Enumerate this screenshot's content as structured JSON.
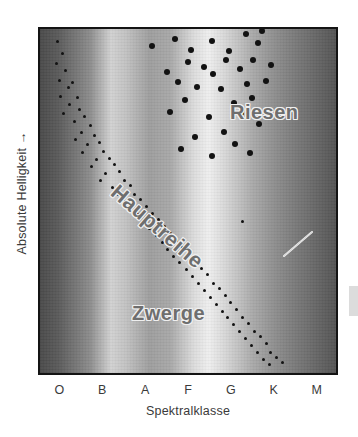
{
  "figure": {
    "axes": {
      "y_label": "Absolute Helligkeit →",
      "x_label": "Spektralklasse",
      "x_ticks": [
        "O",
        "B",
        "A",
        "F",
        "G",
        "K",
        "M"
      ]
    },
    "annotations": {
      "giants": "Riesen",
      "main_sequence": "Hauptreihe",
      "dwarfs": "Zwerge",
      "sun": "Sonne"
    },
    "colors": {
      "frame": "#141414",
      "star": "#121212",
      "text": "#3a3a3a",
      "label_fill": "#6e6e6e",
      "label_outline": "#f2f2f2",
      "leader_line": "#f0f0f0"
    }
  },
  "chart_data": {
    "type": "scatter",
    "xlabel": "Spektralklasse",
    "ylabel": "Absolute Helligkeit →",
    "xlim": [
      0,
      100
    ],
    "ylim": [
      0,
      100
    ],
    "grid": false,
    "legend": "none",
    "x_tick_labels": [
      "O",
      "B",
      "A",
      "F",
      "G",
      "K",
      "M"
    ],
    "x_tick_positions": [
      7.1,
      21.4,
      35.7,
      50.0,
      64.3,
      78.6,
      92.9
    ],
    "x_axis_note": "Spectral class, hot/blue (O) at left to cool/red (M) at right",
    "y_axis_note": "Absolute brightness increasing upward",
    "background": "vertical spectral gradient bands, dark at edges, bright near A and G",
    "annotations": [
      {
        "text": "Riesen",
        "x": 53.5,
        "y": 80.5,
        "rotation": 0,
        "meaning": "giants"
      },
      {
        "text": "Hauptreihe",
        "x": 13.0,
        "y": 57.0,
        "rotation": 41,
        "meaning": "main sequence"
      },
      {
        "text": "Zwerge",
        "x": 19.0,
        "y": 22.5,
        "rotation": 0,
        "meaning": "dwarfs"
      },
      {
        "text": "Sonne",
        "x": 78.0,
        "y": 53.5,
        "rotation": 0,
        "meaning": "the Sun",
        "leader_from": [
          77.0,
          51.5
        ],
        "leader_to": [
          68.5,
          44.0
        ]
      }
    ],
    "series": [
      {
        "name": "Riesen",
        "marker_size": 6,
        "points": [
          [
            38.0,
            95.0
          ],
          [
            45.5,
            97.0
          ],
          [
            51.0,
            94.0
          ],
          [
            58.0,
            96.5
          ],
          [
            64.0,
            93.5
          ],
          [
            69.5,
            98.5
          ],
          [
            73.5,
            96.0
          ],
          [
            75.0,
            99.5
          ],
          [
            63.0,
            91.0
          ],
          [
            55.5,
            89.0
          ],
          [
            50.0,
            90.5
          ],
          [
            43.0,
            87.5
          ],
          [
            58.5,
            87.0
          ],
          [
            67.5,
            88.5
          ],
          [
            72.0,
            91.0
          ],
          [
            78.0,
            89.5
          ],
          [
            46.5,
            84.5
          ],
          [
            53.0,
            83.0
          ],
          [
            61.0,
            82.5
          ],
          [
            70.0,
            84.0
          ],
          [
            76.5,
            85.0
          ],
          [
            49.0,
            79.5
          ],
          [
            65.5,
            78.5
          ],
          [
            71.5,
            80.0
          ],
          [
            44.0,
            76.0
          ],
          [
            57.0,
            74.5
          ],
          [
            68.0,
            75.5
          ],
          [
            74.0,
            72.5
          ],
          [
            62.0,
            70.0
          ],
          [
            52.5,
            68.5
          ],
          [
            66.0,
            66.5
          ],
          [
            71.0,
            64.0
          ],
          [
            58.0,
            63.0
          ],
          [
            47.5,
            65.0
          ]
        ]
      },
      {
        "name": "Hauptreihe",
        "marker_size": 3,
        "points": [
          [
            6.0,
            96.5
          ],
          [
            7.5,
            93.0
          ],
          [
            5.5,
            90.0
          ],
          [
            8.5,
            88.0
          ],
          [
            6.5,
            85.0
          ],
          [
            9.5,
            83.0
          ],
          [
            7.0,
            80.5
          ],
          [
            11.0,
            84.5
          ],
          [
            10.0,
            78.0
          ],
          [
            12.5,
            80.0
          ],
          [
            8.0,
            75.5
          ],
          [
            13.5,
            76.5
          ],
          [
            11.5,
            73.0
          ],
          [
            15.0,
            74.5
          ],
          [
            14.0,
            70.0
          ],
          [
            17.0,
            72.0
          ],
          [
            12.0,
            68.0
          ],
          [
            18.5,
            69.0
          ],
          [
            16.0,
            66.5
          ],
          [
            20.0,
            67.0
          ],
          [
            14.5,
            64.0
          ],
          [
            21.5,
            64.5
          ],
          [
            19.0,
            62.0
          ],
          [
            23.5,
            62.5
          ],
          [
            17.5,
            60.0
          ],
          [
            25.0,
            60.5
          ],
          [
            22.0,
            58.0
          ],
          [
            27.0,
            58.5
          ],
          [
            20.5,
            56.0
          ],
          [
            28.5,
            56.0
          ],
          [
            24.5,
            54.0
          ],
          [
            30.5,
            54.5
          ],
          [
            26.5,
            52.0
          ],
          [
            32.0,
            52.0
          ],
          [
            29.0,
            50.0
          ],
          [
            34.0,
            50.5
          ],
          [
            31.0,
            48.0
          ],
          [
            36.0,
            48.5
          ],
          [
            33.0,
            46.0
          ],
          [
            38.0,
            46.5
          ],
          [
            35.0,
            44.0
          ],
          [
            40.0,
            44.5
          ],
          [
            37.0,
            42.0
          ],
          [
            42.0,
            42.5
          ],
          [
            39.5,
            40.0
          ],
          [
            44.0,
            40.5
          ],
          [
            41.5,
            38.0
          ],
          [
            46.0,
            38.5
          ],
          [
            43.0,
            36.0
          ],
          [
            48.0,
            36.5
          ],
          [
            45.0,
            34.0
          ],
          [
            50.0,
            34.5
          ],
          [
            47.0,
            32.0
          ],
          [
            52.5,
            32.5
          ],
          [
            49.5,
            30.0
          ],
          [
            54.5,
            30.5
          ],
          [
            51.5,
            28.0
          ],
          [
            56.5,
            28.5
          ],
          [
            53.5,
            26.0
          ],
          [
            58.5,
            26.0
          ],
          [
            55.5,
            24.0
          ],
          [
            60.5,
            24.5
          ],
          [
            57.5,
            22.0
          ],
          [
            62.5,
            22.5
          ],
          [
            59.5,
            20.0
          ],
          [
            64.5,
            20.5
          ],
          [
            61.5,
            18.0
          ],
          [
            66.5,
            18.5
          ],
          [
            63.5,
            16.0
          ],
          [
            68.5,
            16.0
          ],
          [
            65.5,
            14.0
          ],
          [
            70.5,
            14.5
          ],
          [
            67.5,
            12.0
          ],
          [
            72.5,
            12.0
          ],
          [
            69.5,
            10.0
          ],
          [
            74.5,
            10.5
          ],
          [
            71.5,
            8.0
          ],
          [
            76.5,
            8.5
          ],
          [
            73.5,
            6.0
          ],
          [
            78.0,
            6.0
          ],
          [
            80.0,
            4.5
          ],
          [
            75.5,
            4.0
          ],
          [
            82.0,
            3.0
          ],
          [
            77.5,
            2.5
          ]
        ]
      },
      {
        "name": "Sonne",
        "marker_size": 3,
        "points": [
          [
            68.5,
            44.0
          ]
        ]
      }
    ]
  }
}
